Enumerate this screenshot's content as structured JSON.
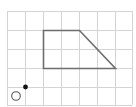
{
  "diagram": {
    "type": "grid-figure",
    "colors": {
      "background": "#ffffff",
      "grid_line": "#d4d4d4",
      "shape_stroke": "#6e6e6e",
      "point_fill": "#111111",
      "circle_stroke": "#555555"
    },
    "grid": {
      "origin_x": 7,
      "origin_y": 11,
      "columns": 7,
      "rows": 5,
      "x_lines": [
        7,
        25,
        43,
        61,
        79,
        97,
        115,
        132
      ],
      "y_lines": [
        11,
        30,
        49,
        68,
        87,
        105
      ]
    },
    "trapezoid": {
      "label": "trapezoid",
      "vertices_px": [
        [
          43,
          30
        ],
        [
          79,
          30
        ],
        [
          115,
          68
        ],
        [
          43,
          68
        ]
      ],
      "vertices_grid": [
        [
          2,
          1
        ],
        [
          4,
          1
        ],
        [
          6,
          3
        ],
        [
          2,
          3
        ]
      ]
    },
    "filled_point": {
      "cx": 25,
      "cy": 87,
      "r": 2.4,
      "grid": [
        1,
        4
      ]
    },
    "open_circle": {
      "cx": 16,
      "cy": 96,
      "r": 4.3
    }
  }
}
